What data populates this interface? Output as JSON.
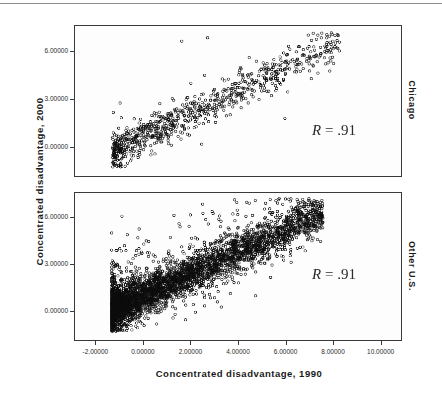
{
  "figure": {
    "axis_titles": {
      "y": "Concentrated disadvantage, 2000",
      "x": "Concentrated disadvantage, 1990"
    },
    "panels": [
      {
        "key": "chicago",
        "strip_label": "Chicago",
        "annotation_r": "R",
        "annotation_eq": "= .91"
      },
      {
        "key": "other",
        "strip_label": "Other U.S.",
        "annotation_r": "R",
        "annotation_eq": "= .91"
      }
    ]
  },
  "chart_data": {
    "type": "scatter",
    "title": "",
    "xlabel": "Concentrated disadvantage, 1990",
    "ylabel": "Concentrated disadvantage, 2000",
    "xlim": [
      -2.9,
      10.9
    ],
    "ylim": [
      -1.9,
      7.6
    ],
    "xticks": [
      -2,
      0,
      2,
      4,
      6,
      8,
      10
    ],
    "xticklabels": [
      "-2.00000",
      "0.00000",
      "2.00000",
      "4.00000",
      "6.00000",
      "8.00000",
      "10.00000"
    ],
    "yticks": [
      0,
      3,
      6
    ],
    "yticklabels": [
      "0.00000",
      "3.00000",
      "6.00000"
    ],
    "grid": false,
    "legend": "none",
    "marker": "open-circle",
    "marker_color": "#111111",
    "panels": [
      {
        "name": "Chicago",
        "strip_position": "right",
        "r": 0.91,
        "annotation": "R = .91",
        "n_points": 840,
        "x_range": [
          -1.3,
          8.3
        ],
        "y_range": [
          -1.2,
          7.0
        ],
        "slope": 0.72,
        "intercept": 0.55,
        "scatter_sd": 0.52,
        "cluster_bias": "dense low-left cluster near x=-1.2..0.5, y=-1.1..0.2",
        "seed": 1990
      },
      {
        "name": "Other U.S.",
        "strip_position": "right",
        "r": 0.91,
        "annotation": "R = .91",
        "n_points": 4200,
        "x_range": [
          -1.35,
          7.6
        ],
        "y_range": [
          -1.3,
          7.0
        ],
        "slope": 0.7,
        "intercept": 0.95,
        "scatter_sd": 0.62,
        "cluster_bias": "very dense band from x=-1.3 to x=4, upper-left outlier fan",
        "seed": 2000
      }
    ]
  }
}
